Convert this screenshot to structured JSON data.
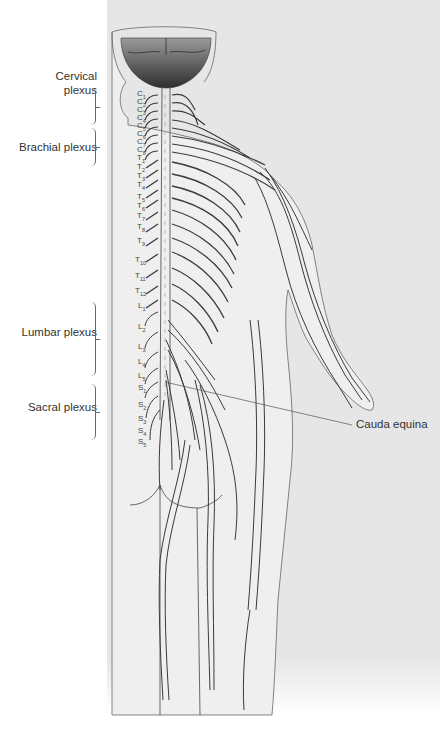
{
  "diagram": {
    "type": "anatomical illustration",
    "colors": {
      "panel_background": "#e6e6e6",
      "skin_fill": "#ececec",
      "outline": "#555555",
      "nerve_stroke": "#3a3a3a",
      "brain_dark": "#3a3a3a",
      "label_text": "#333333"
    }
  },
  "plexus_labels": [
    {
      "id": "cervical",
      "text_line1": "Cervical",
      "text_line2": "plexus"
    },
    {
      "id": "brachial",
      "text_line1": "Brachial plexus",
      "text_line2": ""
    },
    {
      "id": "lumbar",
      "text_line1": "Lumbar plexus",
      "text_line2": ""
    },
    {
      "id": "sacral",
      "text_line1": "Sacral plexus",
      "text_line2": ""
    }
  ],
  "segments": {
    "cervical": [
      {
        "letter": "C",
        "num": "1"
      },
      {
        "letter": "C",
        "num": "2"
      },
      {
        "letter": "C",
        "num": "3"
      },
      {
        "letter": "C",
        "num": "4"
      },
      {
        "letter": "C",
        "num": "5"
      },
      {
        "letter": "C",
        "num": "6"
      },
      {
        "letter": "C",
        "num": "7"
      },
      {
        "letter": "C",
        "num": "8"
      }
    ],
    "thoracic": [
      {
        "letter": "T",
        "num": "1"
      },
      {
        "letter": "T",
        "num": "2"
      },
      {
        "letter": "T",
        "num": "3"
      },
      {
        "letter": "T",
        "num": "4"
      },
      {
        "letter": "T",
        "num": "5"
      },
      {
        "letter": "T",
        "num": "6"
      },
      {
        "letter": "T",
        "num": "7"
      },
      {
        "letter": "T",
        "num": "8"
      },
      {
        "letter": "T",
        "num": "9"
      },
      {
        "letter": "T",
        "num": "10"
      },
      {
        "letter": "T",
        "num": "11"
      },
      {
        "letter": "T",
        "num": "12"
      }
    ],
    "lumbar": [
      {
        "letter": "L",
        "num": "1"
      },
      {
        "letter": "L",
        "num": "2"
      },
      {
        "letter": "L",
        "num": "3"
      },
      {
        "letter": "L",
        "num": "4"
      },
      {
        "letter": "L",
        "num": "5"
      }
    ],
    "sacral": [
      {
        "letter": "S",
        "num": "1"
      },
      {
        "letter": "S",
        "num": "2"
      },
      {
        "letter": "S",
        "num": "3"
      },
      {
        "letter": "S",
        "num": "4"
      },
      {
        "letter": "S",
        "num": "5"
      }
    ]
  },
  "callouts": [
    {
      "id": "cauda-equina",
      "text": "Cauda equina"
    }
  ]
}
